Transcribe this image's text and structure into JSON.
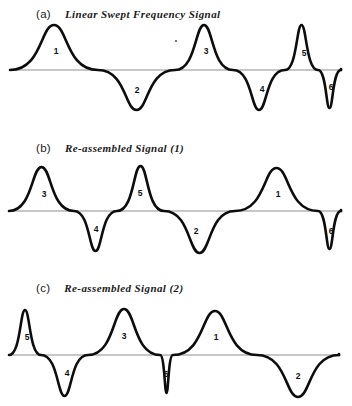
{
  "figure": {
    "width": 352,
    "height": 406,
    "background": "#ffffff",
    "stroke_color": "#0d0d0d",
    "baseline_color": "#8f8f8f",
    "label_color": "#101010"
  },
  "panels": [
    {
      "id": "panel-a",
      "letter": "(a)",
      "title": "Linear Swept Frequency Signal",
      "caption_x": 36,
      "caption_y": 8,
      "top": 0,
      "height": 128,
      "baseline_y": 70,
      "baseline_x0": 10,
      "baseline_x1": 341,
      "wave_start_x": 10,
      "wave_end_x": 341,
      "lobes": [
        {
          "number": "1",
          "x0": 10,
          "x1": 98,
          "sign": 1,
          "amp": 45,
          "label_x": 56,
          "label_y": 52
        },
        {
          "number": "2",
          "x0": 98,
          "x1": 175,
          "sign": -1,
          "amp": 40,
          "label_x": 137,
          "label_y": 91
        },
        {
          "number": "3",
          "x0": 175,
          "x1": 233,
          "sign": 1,
          "amp": 45,
          "label_x": 206,
          "label_y": 52
        },
        {
          "number": "4",
          "x0": 233,
          "x1": 285,
          "sign": -1,
          "amp": 40,
          "label_x": 262,
          "label_y": 90
        },
        {
          "number": "5",
          "x0": 285,
          "x1": 318,
          "sign": 1,
          "amp": 45,
          "label_x": 304,
          "label_y": 54
        },
        {
          "number": "6",
          "x0": 318,
          "x1": 341,
          "sign": -1,
          "amp": 38,
          "label_x": 331,
          "label_y": 88
        }
      ],
      "specks": [
        {
          "x": 176,
          "y": 41,
          "r": 1.1
        }
      ]
    },
    {
      "id": "panel-b",
      "letter": "(b)",
      "title": "Re-assembled Signal (1)",
      "caption_x": 36,
      "caption_y": 142,
      "top": 130,
      "height": 135,
      "baseline_y": 211,
      "baseline_x0": 9,
      "baseline_x1": 341,
      "wave_start_x": 9,
      "wave_end_x": 341,
      "lobes": [
        {
          "number": "3",
          "x0": 9,
          "x1": 74,
          "sign": 1,
          "amp": 44,
          "label_x": 44,
          "label_y": 195
        },
        {
          "number": "4",
          "x0": 74,
          "x1": 117,
          "sign": -1,
          "amp": 40,
          "label_x": 96,
          "label_y": 230
        },
        {
          "number": "5",
          "x0": 117,
          "x1": 164,
          "sign": 1,
          "amp": 45,
          "label_x": 140,
          "label_y": 194
        },
        {
          "number": "2",
          "x0": 164,
          "x1": 235,
          "sign": -1,
          "amp": 42,
          "label_x": 196,
          "label_y": 232
        },
        {
          "number": "1",
          "x0": 235,
          "x1": 318,
          "sign": 1,
          "amp": 43,
          "label_x": 278,
          "label_y": 195
        },
        {
          "number": "6",
          "x0": 318,
          "x1": 341,
          "sign": -1,
          "amp": 38,
          "label_x": 331,
          "label_y": 232
        }
      ],
      "specks": []
    },
    {
      "id": "panel-c",
      "letter": "(c)",
      "title": "Re-assembled Signal (2)",
      "caption_x": 36,
      "caption_y": 282,
      "top": 268,
      "height": 138,
      "baseline_y": 355,
      "baseline_x0": 9,
      "baseline_x1": 339,
      "wave_start_x": 9,
      "wave_end_x": 339,
      "lobes": [
        {
          "number": "5",
          "x0": 9,
          "x1": 41,
          "sign": 1,
          "amp": 45,
          "label_x": 27,
          "label_y": 338
        },
        {
          "number": "4",
          "x0": 41,
          "x1": 88,
          "sign": -1,
          "amp": 41,
          "label_x": 67,
          "label_y": 374
        },
        {
          "number": "3",
          "x0": 88,
          "x1": 160,
          "sign": 1,
          "amp": 46,
          "label_x": 124,
          "label_y": 337
        },
        {
          "number": "6",
          "x0": 160,
          "x1": 173,
          "sign": -1,
          "amp": 38,
          "label_x": 166,
          "label_y": 375
        },
        {
          "number": "1",
          "x0": 173,
          "x1": 257,
          "sign": 1,
          "amp": 44,
          "label_x": 216,
          "label_y": 338
        },
        {
          "number": "2",
          "x0": 257,
          "x1": 339,
          "sign": -1,
          "amp": 42,
          "label_x": 298,
          "label_y": 377
        }
      ],
      "specks": []
    }
  ],
  "chart_data": {
    "type": "line",
    "xlabel": "",
    "ylabel": "",
    "grid": false,
    "legend_position": "none",
    "series": [
      {
        "name": "(a) Linear Swept Frequency Signal",
        "description": "Chirp: half-cycle lobes of monotonically decreasing width left to right",
        "lobe_order": [
          "1",
          "2",
          "3",
          "4",
          "5",
          "6"
        ],
        "lobe_signs": [
          1,
          -1,
          1,
          -1,
          1,
          -1
        ],
        "lobe_widths": [
          88,
          77,
          58,
          52,
          33,
          23
        ],
        "lobe_amplitudes": [
          45,
          40,
          45,
          40,
          45,
          38
        ]
      },
      {
        "name": "(b) Re-assembled Signal (1)",
        "description": "Same six half-cycle lobes re-ordered",
        "lobe_order": [
          "3",
          "4",
          "5",
          "2",
          "1",
          "6"
        ],
        "lobe_signs": [
          1,
          -1,
          1,
          -1,
          1,
          -1
        ],
        "lobe_widths": [
          65,
          43,
          47,
          71,
          83,
          23
        ],
        "lobe_amplitudes": [
          44,
          40,
          45,
          42,
          43,
          38
        ]
      },
      {
        "name": "(c) Re-assembled Signal (2)",
        "description": "Same six half-cycle lobes in a third order",
        "lobe_order": [
          "5",
          "4",
          "3",
          "6",
          "1",
          "2"
        ],
        "lobe_signs": [
          1,
          -1,
          1,
          -1,
          1,
          -1
        ],
        "lobe_widths": [
          32,
          47,
          72,
          13,
          84,
          82
        ],
        "lobe_amplitudes": [
          45,
          41,
          46,
          38,
          44,
          42
        ]
      }
    ]
  }
}
